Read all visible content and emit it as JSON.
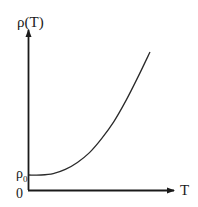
{
  "chart_data": {
    "type": "line",
    "title": "",
    "xlabel": "T",
    "ylabel": "ρ(T)",
    "y_ticks": [
      {
        "label": "0",
        "value": 0
      },
      {
        "label": "ρ₀",
        "value": "rho0"
      }
    ],
    "series": [
      {
        "name": "ρ(T)",
        "description": "Resistivity starts flat at residual value ρ₀ at low T, then rises increasingly steeply (roughly ρ₀ + aT^n)",
        "x": [
          0,
          0.1,
          0.2,
          0.3,
          0.4,
          0.5,
          0.6,
          0.7,
          0.8,
          0.9,
          1.0
        ],
        "y": [
          0.12,
          0.12,
          0.13,
          0.16,
          0.21,
          0.28,
          0.38,
          0.5,
          0.65,
          0.82,
          1.0
        ]
      }
    ],
    "grid": false,
    "legend": "none",
    "axes": {
      "x_arrow": true,
      "y_arrow": true
    }
  },
  "labels": {
    "y_axis": "ρ(T)",
    "x_axis": "T",
    "origin": "0",
    "rho0_main": "ρ",
    "rho0_sub": "0"
  }
}
